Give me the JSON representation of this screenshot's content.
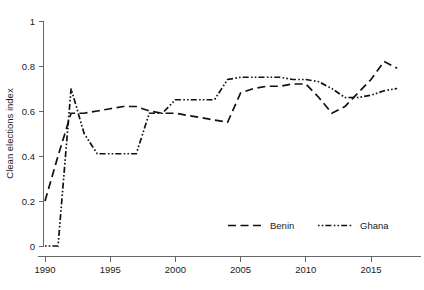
{
  "chart_data": {
    "type": "line",
    "title": "",
    "subtitle": "",
    "xlabel": "",
    "ylabel": "Clean elections index",
    "xlim": [
      1989.2,
      1018.0
    ],
    "ylim": [
      0,
      1
    ],
    "grid": false,
    "legend_position": "bottom-right",
    "x_ticks": [
      "1990",
      "1995",
      "2000",
      "2005",
      "2010",
      "2015"
    ],
    "x_tick_values": [
      1990,
      1995,
      2000,
      2005,
      2010,
      2015
    ],
    "y_ticks": [
      "0",
      "0.2",
      "0.4",
      "0.6",
      "0.8",
      "1"
    ],
    "y_tick_values": [
      0,
      0.2,
      0.4,
      0.6,
      0.8,
      1
    ],
    "x": [
      1990,
      1991,
      1992,
      1993,
      1994,
      1995,
      1996,
      1997,
      1998,
      1999,
      2000,
      2001,
      2002,
      2003,
      2004,
      2005,
      2006,
      2007,
      2008,
      2009,
      2010,
      2011,
      2012,
      2013,
      2014,
      2015,
      2016,
      2017
    ],
    "series": [
      {
        "name": "Benin",
        "dash": "dashed",
        "values": [
          0.2,
          0.4,
          0.59,
          0.59,
          0.6,
          0.61,
          0.62,
          0.62,
          0.6,
          0.59,
          0.59,
          0.58,
          0.57,
          0.56,
          0.55,
          0.68,
          0.7,
          0.71,
          0.71,
          0.72,
          0.72,
          0.66,
          0.59,
          0.62,
          0.68,
          0.74,
          0.82,
          0.79
        ]
      },
      {
        "name": "Ghana",
        "dash": "dash-dot-dot",
        "values": [
          0.0,
          0.0,
          0.7,
          0.5,
          0.41,
          0.41,
          0.41,
          0.41,
          0.59,
          0.59,
          0.65,
          0.65,
          0.65,
          0.65,
          0.74,
          0.75,
          0.75,
          0.75,
          0.75,
          0.74,
          0.74,
          0.73,
          0.7,
          0.66,
          0.66,
          0.67,
          0.69,
          0.7
        ]
      }
    ]
  },
  "legend": {
    "entries": [
      {
        "label": "Benin"
      },
      {
        "label": "Ghana"
      }
    ]
  }
}
